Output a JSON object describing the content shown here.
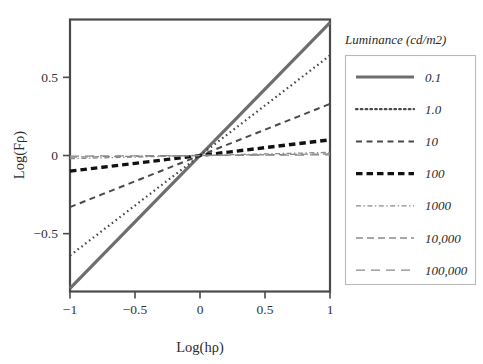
{
  "chart_data": {
    "type": "line",
    "title": "",
    "xlabel": "Log(hρ)",
    "ylabel": "Log(Fρ)",
    "xlim": [
      -1,
      1
    ],
    "ylim": [
      -0.87,
      0.87
    ],
    "xticks": [
      -1,
      -0.5,
      0,
      0.5,
      1
    ],
    "xticklabels": [
      "−1",
      "−0.5",
      "0",
      "0.5",
      "1"
    ],
    "yticks": [
      0.5,
      0,
      -0.5
    ],
    "yticklabels": [
      "0.5",
      "0",
      "−0.5"
    ],
    "grid": false,
    "legend_position": "right",
    "legend_title": "Luminance  (cd/m2)",
    "x": [
      -1,
      -0.75,
      -0.5,
      -0.25,
      0,
      0.25,
      0.5,
      0.75,
      1
    ],
    "series": [
      {
        "name": "0.1",
        "style": "solid",
        "color": "#6e6e6e",
        "width": 3.2,
        "slope": 0.85,
        "values": [
          -0.85,
          -0.6375,
          -0.425,
          -0.2125,
          0,
          0.2125,
          0.425,
          0.6375,
          0.85
        ]
      },
      {
        "name": "1.0",
        "style": "dotted",
        "color": "#4a4a4a",
        "width": 2.2,
        "slope": 0.64,
        "values": [
          -0.64,
          -0.48,
          -0.32,
          -0.16,
          0,
          0.16,
          0.32,
          0.48,
          0.64
        ]
      },
      {
        "name": "10",
        "style": "dashed",
        "color": "#4a4a4a",
        "width": 2.0,
        "slope": 0.33,
        "values": [
          -0.33,
          -0.2475,
          -0.165,
          -0.0825,
          0,
          0.0825,
          0.165,
          0.2475,
          0.33
        ]
      },
      {
        "name": "100",
        "style": "dashed-bold",
        "color": "#111111",
        "width": 3.4,
        "slope": 0.1,
        "values": [
          -0.1,
          -0.075,
          -0.05,
          -0.025,
          0,
          0.025,
          0.05,
          0.075,
          0.1
        ]
      },
      {
        "name": "1000",
        "style": "dashdot",
        "color": "#8a8a8a",
        "width": 1.3,
        "slope": 0.02,
        "values": [
          -0.02,
          -0.015,
          -0.01,
          -0.005,
          0,
          0.005,
          0.01,
          0.015,
          0.02
        ]
      },
      {
        "name": "10,000",
        "style": "dashed-med",
        "color": "#8a8a8a",
        "width": 1.3,
        "slope": 0.01,
        "values": [
          -0.01,
          -0.0075,
          -0.005,
          -0.0025,
          0,
          0.0025,
          0.005,
          0.0075,
          0.01
        ]
      },
      {
        "name": "100,000",
        "style": "dashed-long",
        "color": "#8a8a8a",
        "width": 1.3,
        "slope": 0.004,
        "values": [
          -0.004,
          -0.003,
          -0.002,
          -0.001,
          0,
          0.001,
          0.002,
          0.003,
          0.004
        ]
      }
    ]
  },
  "legend": {
    "title": "Luminance  (cd/m2)",
    "entries": [
      {
        "label": "0.1"
      },
      {
        "label": "1.0"
      },
      {
        "label": "10"
      },
      {
        "label": "100"
      },
      {
        "label": "1000"
      },
      {
        "label": "10,000"
      },
      {
        "label": "100,000"
      }
    ]
  },
  "axes": {
    "x_title": "Log(hρ)",
    "y_title": "Log(Fρ)",
    "x_tick_labels": [
      "−1",
      "−0.5",
      "0",
      "0.5",
      "1"
    ],
    "y_tick_labels": [
      "0.5",
      "0",
      "−0.5"
    ]
  }
}
